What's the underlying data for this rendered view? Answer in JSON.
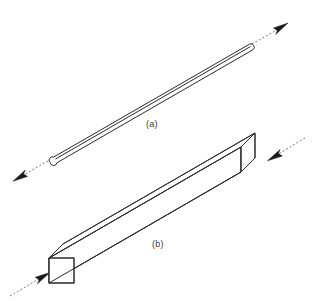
{
  "figure": {
    "background_color": "#ffffff",
    "line_color": "#2b2b2b",
    "force_line_color": "#6d6d6d",
    "arrow_color": "#1a1a1a",
    "width": 313,
    "height": 301
  },
  "panels": [
    {
      "id": "a",
      "label": "(a)",
      "object": "slender-rod",
      "shape": "thin rod with rounded (semicircular) ends",
      "loading": "tension",
      "arrow_direction": "outward along rod axis",
      "axis_angle_deg": 27,
      "label_position": {
        "x": 146,
        "y": 119
      }
    },
    {
      "id": "b",
      "label": "(b)",
      "object": "rectangular-prismatic-bar",
      "shape": "square cross-section bar drawn in isometric projection",
      "loading": "compression",
      "arrow_direction": "inward toward bar ends along axis",
      "axis_angle_deg": 27,
      "label_position": {
        "x": 152,
        "y": 239
      }
    }
  ],
  "geometry": {
    "rod": {
      "start": {
        "x": 52,
        "y": 159
      },
      "end": {
        "x": 248,
        "y": 46
      },
      "half_thickness": 3.2,
      "end_cap": "round"
    },
    "rod_force_lower": {
      "from": {
        "x": 46,
        "y": 162
      },
      "to": {
        "x": 18,
        "y": 178
      },
      "arrow_at": {
        "x": 14,
        "y": 180
      }
    },
    "rod_force_upper": {
      "from": {
        "x": 254,
        "y": 43
      },
      "to": {
        "x": 281,
        "y": 27
      },
      "arrow_at": {
        "x": 285,
        "y": 25
      }
    },
    "bar": {
      "front_face_top_left": {
        "x": 49,
        "y": 258
      },
      "front_face_bottom_left": {
        "x": 49,
        "y": 283
      },
      "front_face_top_right": {
        "x": 74,
        "y": 258
      },
      "front_face_bottom_right": {
        "x": 74,
        "y": 283
      },
      "depth_offset": {
        "dx": 14,
        "dy": -14
      },
      "length_offset": {
        "dx": 192,
        "dy": -111
      }
    },
    "bar_force_left": {
      "from": {
        "x": 12,
        "y": 295
      },
      "to": {
        "x": 42,
        "y": 277
      },
      "arrow_at": {
        "x": 46,
        "y": 275
      }
    },
    "bar_force_right": {
      "from": {
        "x": 303,
        "y": 139
      },
      "to": {
        "x": 273,
        "y": 157
      },
      "arrow_at": {
        "x": 269,
        "y": 159
      }
    }
  }
}
